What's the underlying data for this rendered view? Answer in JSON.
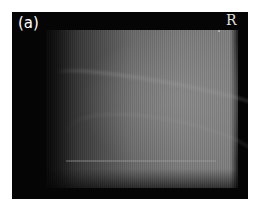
{
  "image": {
    "panel_label": "(a)",
    "side_marker": "R",
    "description": "Grayscale radiograph with black border"
  },
  "colors": {
    "background": "#ffffff",
    "frame": "#050505",
    "film_mid": "#7c7c7c",
    "label_text": "#ffffff"
  }
}
